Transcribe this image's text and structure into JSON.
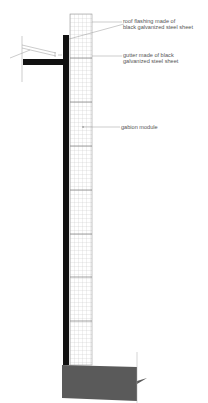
{
  "diagram": {
    "type": "architectural wall section",
    "colors": {
      "wall": "#111111",
      "grid": "#bdbdbd",
      "concrete": "#5a5a5a",
      "line": "#888888"
    },
    "labels": [
      {
        "id": "roof_flashing",
        "line1": "roof flashing made of",
        "line2": "black galvanized steel sheet"
      },
      {
        "id": "gutter",
        "line1": "gutter made of black",
        "line2": "galvanized steel sheet"
      },
      {
        "id": "gabion",
        "line1": "gabion module",
        "line2": ""
      }
    ]
  }
}
